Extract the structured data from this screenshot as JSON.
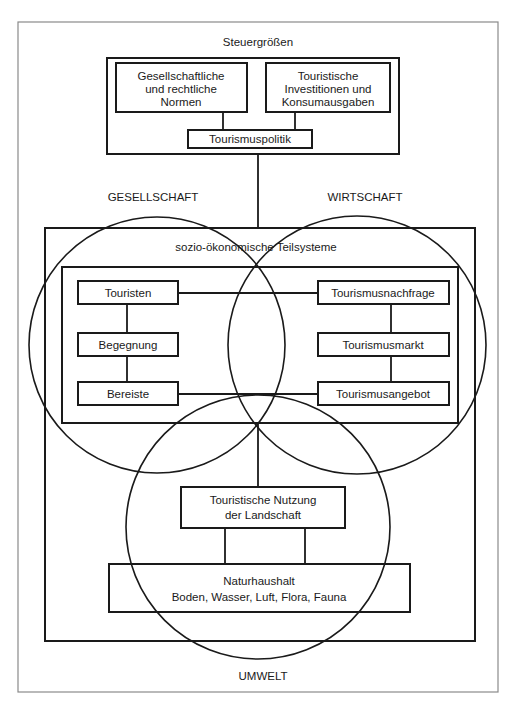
{
  "diagram": {
    "steering": {
      "title": "Steuergrößen",
      "norms": [
        "Gesellschaftliche",
        "und rechtliche",
        "Normen"
      ],
      "investments": [
        "Touristische",
        "Investitionen und",
        "Konsumausgaben"
      ],
      "policy": "Tourismuspolitik"
    },
    "spheres": {
      "society": "GESELLSCHAFT",
      "economy": "WIRTSCHAFT",
      "environment": "UMWELT"
    },
    "socio_economic": {
      "title": "sozio-ökonomische Teilsysteme",
      "left_column": [
        "Touristen",
        "Begegnung",
        "Bereiste"
      ],
      "right_column": [
        "Tourismusnachfrage",
        "Tourismusmarkt",
        "Tourismusangebot"
      ]
    },
    "landscape_use": [
      "Touristische Nutzung",
      "der Landschaft"
    ],
    "nature": {
      "title": "Naturhaushalt",
      "elements": "Boden, Wasser, Luft, Flora, Fauna"
    }
  }
}
